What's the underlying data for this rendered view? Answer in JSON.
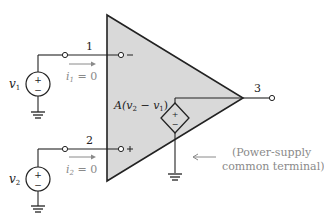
{
  "diagram": {
    "type": "op-amp equivalent circuit",
    "nodes": {
      "inverting": {
        "label": "1",
        "sign": "−"
      },
      "noninverting": {
        "label": "2",
        "sign": "+"
      },
      "output": {
        "label": "3"
      }
    },
    "sources": {
      "v1": {
        "label": "v",
        "sub": "1",
        "polarity_top": "+",
        "polarity_bottom": "−"
      },
      "v2": {
        "label": "v",
        "sub": "2",
        "polarity_top": "+",
        "polarity_bottom": "−"
      },
      "dependent": {
        "label_prefix": "A(v",
        "sub_a": "2",
        "mid": " − v",
        "sub_b": "1",
        "suffix": ")",
        "polarity_top": "+",
        "polarity_bottom": "−"
      }
    },
    "currents": {
      "i1": {
        "label": "i",
        "sub": "1",
        "value": " = 0"
      },
      "i2": {
        "label": "i",
        "sub": "2",
        "value": " = 0"
      }
    },
    "annotation": {
      "line1": "(Power-supply",
      "line2": "common terminal)"
    },
    "colors": {
      "triangle_fill": "#d9d9d9",
      "line": "#222222",
      "annotation": "#8a8a8a"
    }
  }
}
